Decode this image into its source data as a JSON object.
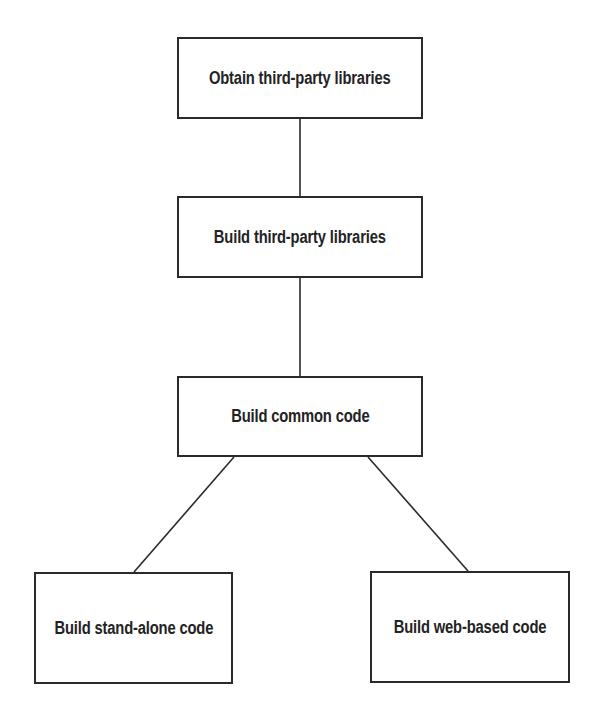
{
  "diagram": {
    "type": "flowchart",
    "nodes": [
      {
        "id": "obtain",
        "label": "Obtain third-party libraries"
      },
      {
        "id": "build3p",
        "label": "Build third-party libraries"
      },
      {
        "id": "common",
        "label": "Build common code"
      },
      {
        "id": "standalone",
        "label": "Build stand-alone code"
      },
      {
        "id": "web",
        "label": "Build web-based code"
      }
    ],
    "edges": [
      {
        "from": "obtain",
        "to": "build3p"
      },
      {
        "from": "build3p",
        "to": "common"
      },
      {
        "from": "common",
        "to": "standalone"
      },
      {
        "from": "common",
        "to": "web"
      }
    ],
    "colors": {
      "line": "#2a2a2a",
      "text": "#232323",
      "background": "#ffffff"
    }
  }
}
